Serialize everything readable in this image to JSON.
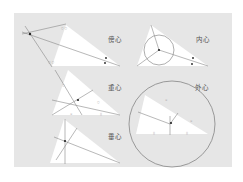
{
  "figure": {
    "background": "#ffffff",
    "panel_color": "#e6e6e6",
    "triangle_fill": "#ffffff",
    "line_color": "#777777",
    "circle_color": "#666666",
    "point_color": "#222222"
  },
  "diagrams": [
    {
      "id": "excenter",
      "label": "傍心",
      "meaning": "excenter"
    },
    {
      "id": "incenter",
      "label": "内心",
      "meaning": "incenter"
    },
    {
      "id": "centroid",
      "label": "重心",
      "meaning": "centroid"
    },
    {
      "id": "circumcenter",
      "label": "外心",
      "meaning": "circumcenter"
    },
    {
      "id": "orthocenter",
      "label": "垂心",
      "meaning": "orthocenter"
    }
  ]
}
